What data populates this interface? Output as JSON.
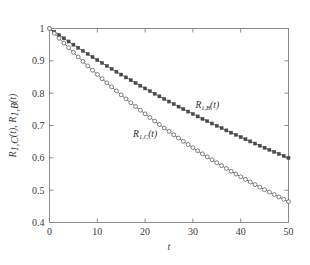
{
  "chart_data": {
    "type": "line",
    "title": "",
    "subtitle": "",
    "xlabel": "t",
    "ylabel": "R_{1,C}(t), R_{1,B}(t)",
    "xlim": [
      0,
      50
    ],
    "ylim": [
      0.4,
      1.0
    ],
    "xticks": [
      0,
      10,
      20,
      30,
      40,
      50
    ],
    "yticks": [
      0.4,
      0.5,
      0.6,
      0.7,
      0.8,
      0.9,
      1
    ],
    "xtick_labels": [
      "0",
      "10",
      "20",
      "30",
      "40",
      "50"
    ],
    "ytick_labels": [
      "0.4",
      "0.5",
      "0.6",
      "0.7",
      "0.8",
      "0.9",
      "1"
    ],
    "grid": false,
    "legend_position": "inline-annotation",
    "series": [
      {
        "name": "R_1B",
        "label_base": "R",
        "label_sub": "1,B",
        "label_arg": "(t)",
        "marker": "filled-square",
        "color": "#4a4a4a",
        "x": [
          0,
          1,
          2,
          3,
          4,
          5,
          6,
          7,
          8,
          9,
          10,
          11,
          12,
          13,
          14,
          15,
          16,
          17,
          18,
          19,
          20,
          21,
          22,
          23,
          24,
          25,
          26,
          27,
          28,
          29,
          30,
          31,
          32,
          33,
          34,
          35,
          36,
          37,
          38,
          39,
          40,
          41,
          42,
          43,
          44,
          45,
          46,
          47,
          48,
          49,
          50
        ],
        "y": [
          1.0,
          0.9898,
          0.9797,
          0.9697,
          0.9598,
          0.95,
          0.9403,
          0.9307,
          0.9212,
          0.9118,
          0.9025,
          0.8933,
          0.8842,
          0.8752,
          0.8663,
          0.8575,
          0.8487,
          0.8401,
          0.8315,
          0.8231,
          0.8147,
          0.8064,
          0.7982,
          0.7901,
          0.7821,
          0.7741,
          0.7662,
          0.7584,
          0.7507,
          0.7431,
          0.7356,
          0.7281,
          0.7207,
          0.7134,
          0.7061,
          0.699,
          0.6919,
          0.6848,
          0.6779,
          0.671,
          0.6642,
          0.6574,
          0.6508,
          0.6441,
          0.6376,
          0.6311,
          0.6247,
          0.6184,
          0.6121,
          0.6059,
          0.5997
        ]
      },
      {
        "name": "R_1C",
        "label_base": "R",
        "label_sub": "1,C",
        "label_arg": "(t)",
        "marker": "open-circle",
        "color": "#5a5a5a",
        "x": [
          0,
          1,
          2,
          3,
          4,
          5,
          6,
          7,
          8,
          9,
          10,
          11,
          12,
          13,
          14,
          15,
          16,
          17,
          18,
          19,
          20,
          21,
          22,
          23,
          24,
          25,
          26,
          27,
          28,
          29,
          30,
          31,
          32,
          33,
          34,
          35,
          36,
          37,
          38,
          39,
          40,
          41,
          42,
          43,
          44,
          45,
          46,
          47,
          48,
          49,
          50
        ],
        "y": [
          1.0,
          0.9848,
          0.9698,
          0.955,
          0.9405,
          0.9262,
          0.9121,
          0.8982,
          0.8846,
          0.8711,
          0.8579,
          0.8448,
          0.832,
          0.8193,
          0.8069,
          0.7946,
          0.7825,
          0.7706,
          0.7589,
          0.7473,
          0.736,
          0.7248,
          0.7138,
          0.7029,
          0.6922,
          0.6817,
          0.6713,
          0.6611,
          0.6511,
          0.6412,
          0.6314,
          0.6218,
          0.6124,
          0.603,
          0.5939,
          0.5848,
          0.5759,
          0.5671,
          0.5585,
          0.55,
          0.5416,
          0.5334,
          0.5252,
          0.5172,
          0.5093,
          0.5016,
          0.4939,
          0.4864,
          0.479,
          0.4717,
          0.4645
        ]
      }
    ],
    "annotations": [
      {
        "text": "R_{1,B}(t)",
        "x": 33,
        "y": 0.755
      },
      {
        "text": "R_{1,C}(t)",
        "x": 20,
        "y": 0.665
      }
    ]
  },
  "axis": {
    "x_title": "t",
    "y_title_parts": [
      {
        "base": "R",
        "sub": "1,C",
        "arg": "(t)"
      },
      {
        "sep": ", "
      },
      {
        "base": "R",
        "sub": "1,B",
        "arg": "(t)"
      }
    ]
  },
  "colors": {
    "axis": "#8a8a8a",
    "text": "#3a3a3a",
    "series_b": "#4a4a4a",
    "series_c": "#5a5a5a",
    "background": "#ffffff"
  }
}
